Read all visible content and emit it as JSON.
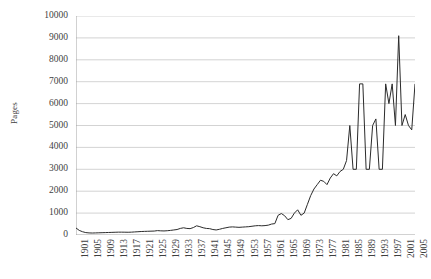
{
  "chart_data": {
    "type": "line",
    "title": "",
    "subtitle": "",
    "xlabel": "",
    "ylabel": "Pages",
    "ylim": [
      0,
      10000
    ],
    "ytick_step": 1000,
    "ytick_labels": [
      "10000",
      "9000",
      "8000",
      "7000",
      "6000",
      "5000",
      "4000",
      "3000",
      "2000",
      "1000",
      "0"
    ],
    "ytick_values": [
      10000,
      9000,
      8000,
      7000,
      6000,
      5000,
      4000,
      3000,
      2000,
      1000,
      0
    ],
    "xlim": [
      1901,
      2005
    ],
    "xtick_step": 4,
    "xtick_labels": [
      "1901",
      "1905",
      "1909",
      "1913",
      "1917",
      "1921",
      "1925",
      "1929",
      "1933",
      "1937",
      "1941",
      "1945",
      "1949",
      "1953",
      "1957",
      "1961",
      "1965",
      "1969",
      "1973",
      "1977",
      "1981",
      "1985",
      "1989",
      "1993",
      "1997",
      "2001",
      "2005"
    ],
    "grid": "horizontal",
    "legend": "none",
    "series_color": "#2b2b2b",
    "grid_color": "#c8c8c8",
    "axis_color": "#9a9a9a",
    "x": [
      1901,
      1902,
      1903,
      1904,
      1905,
      1906,
      1907,
      1908,
      1909,
      1910,
      1911,
      1912,
      1913,
      1914,
      1915,
      1916,
      1917,
      1918,
      1919,
      1920,
      1921,
      1922,
      1923,
      1924,
      1925,
      1926,
      1927,
      1928,
      1929,
      1930,
      1931,
      1932,
      1933,
      1934,
      1935,
      1936,
      1937,
      1938,
      1939,
      1940,
      1941,
      1942,
      1943,
      1944,
      1945,
      1946,
      1947,
      1948,
      1949,
      1950,
      1951,
      1952,
      1953,
      1954,
      1955,
      1956,
      1957,
      1958,
      1959,
      1960,
      1961,
      1962,
      1963,
      1964,
      1965,
      1966,
      1967,
      1968,
      1969,
      1970,
      1971,
      1972,
      1973,
      1974,
      1975,
      1976,
      1977,
      1978,
      1979,
      1980,
      1981,
      1982,
      1983,
      1984,
      1985,
      1986,
      1987,
      1988,
      1989,
      1990,
      1991,
      1992,
      1993,
      1994,
      1995,
      1996,
      1997,
      1998,
      1999,
      2000,
      2001,
      2002,
      2003,
      2004,
      2005
    ],
    "values": [
      320,
      210,
      150,
      110,
      95,
      90,
      95,
      100,
      105,
      110,
      115,
      120,
      125,
      130,
      130,
      128,
      125,
      130,
      140,
      150,
      160,
      165,
      170,
      175,
      180,
      200,
      190,
      185,
      195,
      210,
      230,
      250,
      300,
      330,
      300,
      290,
      340,
      420,
      380,
      330,
      300,
      290,
      250,
      230,
      260,
      300,
      330,
      360,
      370,
      360,
      350,
      360,
      370,
      380,
      400,
      420,
      430,
      420,
      430,
      450,
      500,
      520,
      900,
      980,
      880,
      700,
      760,
      1000,
      1150,
      900,
      1000,
      1400,
      1800,
      2100,
      2300,
      2500,
      2450,
      2300,
      2600,
      2800,
      2700,
      2900,
      3000,
      3400,
      5000,
      3000,
      3000,
      6900,
      6900,
      3000,
      3000,
      5000,
      5300,
      3000,
      3000,
      6900,
      6000,
      6900,
      5000,
      9100,
      5000,
      5500,
      5000,
      4800,
      6900
    ],
    "series_name": "Pages"
  }
}
